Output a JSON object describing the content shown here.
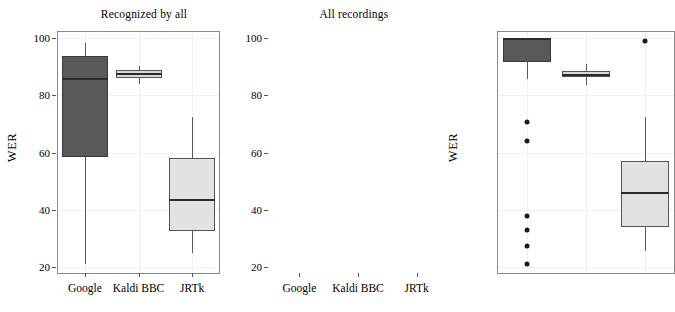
{
  "chart_data": {
    "type": "box",
    "title": "",
    "panels": [
      {
        "title": "Recognized by all",
        "xlabel": "",
        "ylabel": "WER",
        "ylim": [
          18,
          102
        ],
        "yticks": [
          20,
          40,
          60,
          80,
          100
        ],
        "ytick_labels": [
          "20",
          "40",
          "60",
          "80",
          "100"
        ],
        "categories": [
          "Google",
          "Kaldi BBC",
          "JRTk"
        ],
        "boxes": [
          {
            "name": "Google",
            "whisker_low": 21.0,
            "q1": 58.5,
            "median": 85.5,
            "q3": 93.5,
            "whisker_high": 98.0,
            "outliers": [],
            "fill": "#595959"
          },
          {
            "name": "Kaldi BBC",
            "whisker_low": 84.0,
            "q1": 86.0,
            "median": 87.2,
            "q3": 88.7,
            "whisker_high": 90.3,
            "outliers": [],
            "fill": "#d9d9d9"
          },
          {
            "name": "JRTk",
            "whisker_low": 25.0,
            "q1": 32.5,
            "median": 43.5,
            "q3": 58.0,
            "whisker_high": 72.5,
            "outliers": [],
            "fill": "#e2e2e2"
          }
        ]
      },
      {
        "title": "All recordings",
        "xlabel": "",
        "ylabel": "WER",
        "ylim": [
          18,
          102
        ],
        "yticks": [
          20,
          40,
          60,
          80,
          100
        ],
        "ytick_labels": [
          "20",
          "40",
          "60",
          "80",
          "100"
        ],
        "categories": [
          "Google",
          "Kaldi BBC",
          "JRTk"
        ],
        "boxes": [
          {
            "name": "Google",
            "whisker_low": 85.5,
            "q1": 91.5,
            "median": 99.5,
            "q3": 100.0,
            "whisker_high": 100.0,
            "outliers": [
              70.5,
              64.0,
              38.0,
              33.0,
              27.5,
              21.0
            ],
            "fill": "#595959"
          },
          {
            "name": "Kaldi BBC",
            "whisker_low": 83.5,
            "q1": 86.3,
            "median": 87.0,
            "q3": 88.5,
            "whisker_high": 91.0,
            "outliers": [],
            "fill": "#d9d9d9"
          },
          {
            "name": "JRTk",
            "whisker_low": 25.5,
            "q1": 34.0,
            "median": 46.0,
            "q3": 57.0,
            "whisker_high": 72.5,
            "outliers": [
              99.0
            ],
            "fill": "#e2e2e2"
          }
        ]
      }
    ],
    "grid": true,
    "legend": "none"
  }
}
